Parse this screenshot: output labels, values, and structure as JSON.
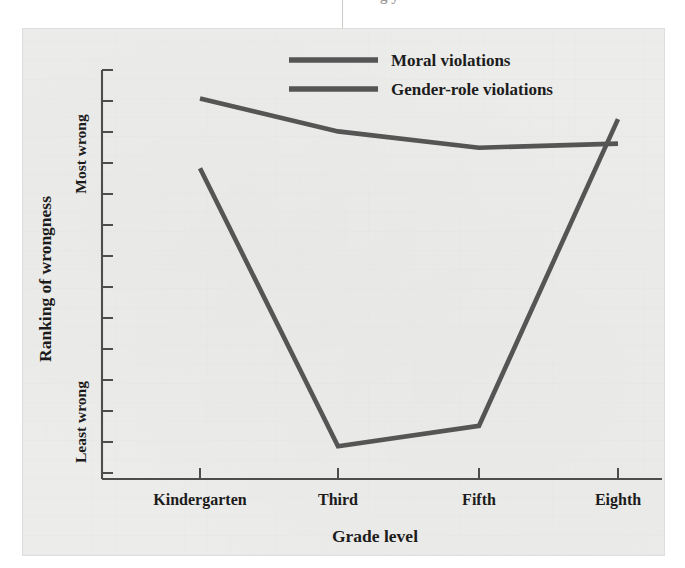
{
  "page": {
    "bleed_text_top": "g    y",
    "background_color": "#ffffff",
    "panel_color": "#ececea"
  },
  "figure": {
    "name": "ranking-of-wrongness-by-grade-level",
    "line_color": "#555555",
    "axis_color": "#4d4d4d"
  },
  "legend": {
    "position": "top-center",
    "entries": [
      {
        "label": "Moral violations",
        "color": "#555555"
      },
      {
        "label": "Gender-role violations",
        "color": "#555555"
      }
    ]
  },
  "axes": {
    "x": {
      "title": "Grade level",
      "tick_labels": [
        "Kindergarten",
        "Third",
        "Fifth",
        "Eighth"
      ],
      "tick_count": 4
    },
    "y": {
      "title": "Ranking of wrongness",
      "tick_labels": [
        "Most wrong",
        "Least wrong"
      ],
      "top_label": "Most wrong",
      "bottom_label": "Least wrong",
      "tick_count": 14
    }
  },
  "chart_data": {
    "type": "line",
    "title": "",
    "xlabel": "Grade level",
    "ylabel": "Ranking of wrongness",
    "categories": [
      "Kindergarten",
      "Third",
      "Fifth",
      "Eighth"
    ],
    "ylim": [
      0,
      1
    ],
    "ytick_labels": [
      "Least wrong",
      "Most wrong"
    ],
    "grid": false,
    "legend_position": "top-center",
    "series": [
      {
        "name": "Moral violations",
        "color": "#555555",
        "values": [
          0.93,
          0.85,
          0.81,
          0.82
        ]
      },
      {
        "name": "Gender-role violations",
        "color": "#555555",
        "values": [
          0.76,
          0.08,
          0.13,
          0.88
        ]
      }
    ]
  }
}
